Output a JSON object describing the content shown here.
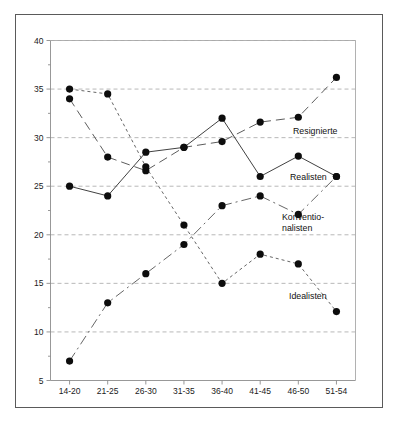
{
  "chart_data": {
    "type": "line",
    "title": "",
    "subtitle": "",
    "xlabel": "",
    "ylabel": "",
    "categories": [
      "14-20",
      "21-25",
      "26-30",
      "31-35",
      "36-40",
      "41-45",
      "46-50",
      "51-54"
    ],
    "ylim": [
      5,
      40
    ],
    "yticks": [
      5,
      10,
      15,
      20,
      25,
      30,
      35,
      40
    ],
    "ytick_labels": [
      "5",
      "10",
      "15",
      "20",
      "25",
      "30",
      "35",
      "40"
    ],
    "grid": true,
    "legend_position": "inline-right",
    "series": [
      {
        "name": "Resignierte",
        "label": "Resignierte",
        "line_style": "long-dash",
        "values": [
          34.0,
          28.0,
          26.6,
          29.0,
          29.6,
          31.6,
          32.1,
          36.2
        ]
      },
      {
        "name": "Realisten",
        "label": "Realisten",
        "line_style": "solid",
        "values": [
          25.0,
          24.0,
          28.5,
          29.0,
          32.0,
          26.0,
          28.1,
          26.0
        ]
      },
      {
        "name": "Konventionalisten",
        "label": "Konventio-\nnalisten",
        "label_line1": "Konventio-",
        "label_line2": "nalisten",
        "line_style": "dash-dot",
        "values": [
          7.0,
          13.0,
          16.0,
          19.0,
          23.0,
          24.0,
          22.1,
          26.0
        ]
      },
      {
        "name": "Idealisten",
        "label": "Idealisten",
        "line_style": "short-dash",
        "values": [
          35.0,
          34.5,
          27.0,
          21.0,
          15.0,
          18.0,
          17.0,
          12.1
        ]
      }
    ],
    "colors": {
      "marker": "#0d0d0d",
      "grid": "#9a9a9a",
      "axis": "#8c8c8c",
      "frame": "#5a5a5a",
      "text": "#1a1a1a",
      "background": "#ffffff"
    },
    "annotations": [
      {
        "text": "Resignierte",
        "series": "Resignierte"
      },
      {
        "text": "Realisten",
        "series": "Realisten"
      },
      {
        "text": "Konventio-",
        "series": "Konventionalisten"
      },
      {
        "text": "nalisten",
        "series": "Konventionalisten"
      },
      {
        "text": "Idealisten",
        "series": "Idealisten"
      }
    ]
  }
}
